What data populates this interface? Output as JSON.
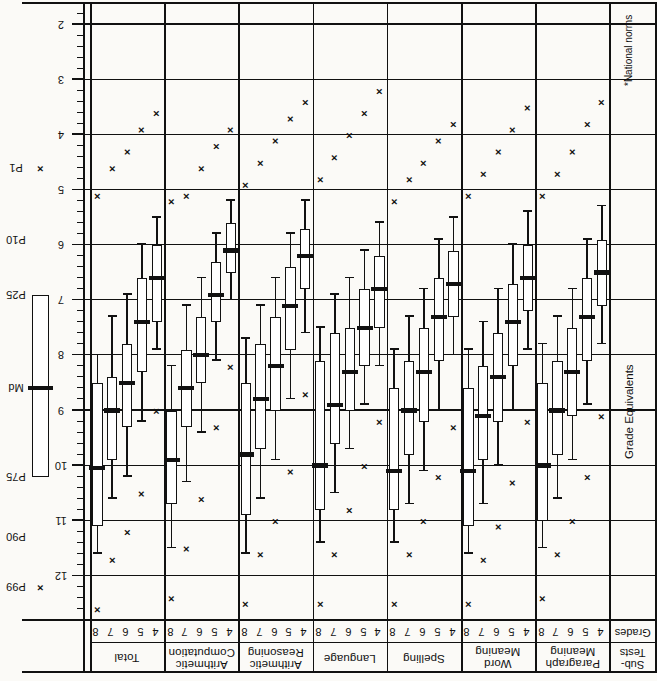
{
  "figure": {
    "axis_title": "Grade Equivalents",
    "footnote": "*National norms",
    "header_subtests": "Sub-\nTests",
    "header_grades": "Grades"
  },
  "legend": {
    "labels": [
      "P99",
      "P90",
      "P75",
      "Md",
      "P25",
      "P10",
      "P1"
    ],
    "marker_note": "box-and-whisker percentile key"
  },
  "axis": {
    "label": "Grade Equivalents",
    "tick_labels": [
      "12",
      "11",
      "10",
      "9",
      "8",
      "7",
      "6",
      "5",
      "4",
      "3",
      "2"
    ],
    "major_values": [
      12,
      11,
      10,
      9,
      8,
      7,
      6,
      5,
      4,
      3,
      2
    ],
    "minor_per_major": 5,
    "range": [
      12.6,
      1.7
    ],
    "direction": "descending-left-to-right"
  },
  "grades": [
    "8",
    "7",
    "6",
    "5",
    "4"
  ],
  "chart_data": {
    "type": "box",
    "xlabel": "Grade Equivalents",
    "ylabel": "Sub-Tests / Grades",
    "xlim": [
      12.6,
      1.7
    ],
    "grid": true,
    "legend_position": "top",
    "percentiles": [
      "P99",
      "P90",
      "P75",
      "Md",
      "P25",
      "P10",
      "P1"
    ],
    "subtests": [
      {
        "name": "Total",
        "rows": [
          {
            "grade": "8",
            "P99": 12.6,
            "P90": 11.6,
            "P75": 11.1,
            "Md": 10.05,
            "P25": 8.5,
            "P10": 8.0,
            "P1": 5.1
          },
          {
            "grade": "7",
            "P99": 11.7,
            "P90": 10.6,
            "P75": 9.9,
            "Md": 9.0,
            "P25": 8.4,
            "P10": 7.3,
            "P1": 4.6
          },
          {
            "grade": "6",
            "P99": 11.2,
            "P90": 10.2,
            "P75": 9.3,
            "Md": 8.5,
            "P25": 7.8,
            "P10": 6.9,
            "P1": 4.3
          },
          {
            "grade": "5",
            "P99": 10.5,
            "P90": 9.2,
            "P75": 8.3,
            "Md": 7.4,
            "P25": 6.6,
            "P10": 6.0,
            "P1": 3.9
          },
          {
            "grade": "4",
            "P99": 9.0,
            "P90": 7.9,
            "P75": 7.4,
            "Md": 6.6,
            "P25": 6.0,
            "P10": 5.5,
            "P1": 3.6
          }
        ]
      },
      {
        "name": "Arithmetic\nComputation",
        "rows": [
          {
            "grade": "8",
            "P99": 12.4,
            "P90": 11.5,
            "P75": 10.7,
            "Md": 9.9,
            "P25": 9.0,
            "P10": 8.2,
            "P1": 5.2
          },
          {
            "grade": "7",
            "P99": 11.5,
            "P90": 10.3,
            "P75": 9.3,
            "Md": 8.6,
            "P25": 7.9,
            "P10": 7.1,
            "P1": 5.1
          },
          {
            "grade": "6",
            "P99": 10.6,
            "P90": 9.4,
            "P75": 8.5,
            "Md": 8.0,
            "P25": 7.3,
            "P10": 6.6,
            "P1": 4.6
          },
          {
            "grade": "5",
            "P99": 9.3,
            "P90": 8.1,
            "P75": 7.4,
            "Md": 6.9,
            "P25": 6.3,
            "P10": 5.8,
            "P1": 4.2
          },
          {
            "grade": "4",
            "P99": 8.2,
            "P90": 7.0,
            "P75": 6.5,
            "Md": 6.1,
            "P25": 5.6,
            "P10": 5.2,
            "P1": 3.9
          }
        ]
      },
      {
        "name": "Arithmetic\nReasoning",
        "rows": [
          {
            "grade": "8",
            "P99": 12.5,
            "P90": 11.6,
            "P75": 10.9,
            "Md": 9.8,
            "P25": 8.5,
            "P10": 7.7,
            "P1": 4.9
          },
          {
            "grade": "7",
            "P99": 11.6,
            "P90": 10.6,
            "P75": 9.7,
            "Md": 8.8,
            "P25": 7.8,
            "P10": 7.1,
            "P1": 4.5
          },
          {
            "grade": "6",
            "P99": 11.0,
            "P90": 9.9,
            "P75": 9.0,
            "Md": 8.2,
            "P25": 7.3,
            "P10": 6.6,
            "P1": 4.1
          },
          {
            "grade": "5",
            "P99": 10.1,
            "P90": 8.8,
            "P75": 7.9,
            "Md": 7.1,
            "P25": 6.4,
            "P10": 5.8,
            "P1": 3.7
          },
          {
            "grade": "4",
            "P99": 8.7,
            "P90": 7.6,
            "P75": 6.8,
            "Md": 6.2,
            "P25": 5.7,
            "P10": 5.2,
            "P1": 3.4
          }
        ]
      },
      {
        "name": "Language",
        "rows": [
          {
            "grade": "8",
            "P99": 12.5,
            "P90": 11.4,
            "P75": 10.8,
            "Md": 10.0,
            "P25": 8.1,
            "P10": 7.5,
            "P1": 4.8
          },
          {
            "grade": "7",
            "P99": 11.6,
            "P90": 10.5,
            "P75": 9.6,
            "Md": 8.9,
            "P25": 7.6,
            "P10": 6.9,
            "P1": 4.4
          },
          {
            "grade": "6",
            "P99": 10.8,
            "P90": 9.7,
            "P75": 9.0,
            "Md": 8.3,
            "P25": 7.5,
            "P10": 6.6,
            "P1": 4.0
          },
          {
            "grade": "5",
            "P99": 10.0,
            "P90": 8.9,
            "P75": 8.2,
            "Md": 7.5,
            "P25": 6.8,
            "P10": 6.1,
            "P1": 3.6
          },
          {
            "grade": "4",
            "P99": 9.2,
            "P90": 8.2,
            "P75": 7.5,
            "Md": 6.8,
            "P25": 6.2,
            "P10": 5.6,
            "P1": 3.2
          }
        ]
      },
      {
        "name": "Spelling",
        "rows": [
          {
            "grade": "8",
            "P99": 12.5,
            "P90": 11.4,
            "P75": 10.8,
            "Md": 10.1,
            "P25": 8.6,
            "P10": 7.9,
            "P1": 5.2
          },
          {
            "grade": "7",
            "P99": 11.6,
            "P90": 10.7,
            "P75": 9.8,
            "Md": 9.0,
            "P25": 8.1,
            "P10": 7.3,
            "P1": 4.8
          },
          {
            "grade": "6",
            "P99": 11.0,
            "P90": 10.1,
            "P75": 9.2,
            "Md": 8.3,
            "P25": 7.5,
            "P10": 6.8,
            "P1": 4.5
          },
          {
            "grade": "5",
            "P99": 10.2,
            "P90": 9.0,
            "P75": 8.1,
            "Md": 7.3,
            "P25": 6.6,
            "P10": 5.9,
            "P1": 4.1
          },
          {
            "grade": "4",
            "P99": 9.3,
            "P90": 8.0,
            "P75": 7.3,
            "Md": 6.7,
            "P25": 6.1,
            "P10": 5.5,
            "P1": 3.8
          }
        ]
      },
      {
        "name": "Word\nMeaning",
        "rows": [
          {
            "grade": "8",
            "P99": 12.5,
            "P90": 11.6,
            "P75": 11.1,
            "Md": 10.1,
            "P25": 8.6,
            "P10": 7.9,
            "P1": 5.1
          },
          {
            "grade": "7",
            "P99": 11.7,
            "P90": 10.7,
            "P75": 9.9,
            "Md": 9.1,
            "P25": 8.2,
            "P10": 7.4,
            "P1": 4.7
          },
          {
            "grade": "6",
            "P99": 11.1,
            "P90": 10.0,
            "P75": 9.2,
            "Md": 8.4,
            "P25": 7.6,
            "P10": 6.8,
            "P1": 4.3
          },
          {
            "grade": "5",
            "P99": 10.3,
            "P90": 9.0,
            "P75": 8.2,
            "Md": 7.4,
            "P25": 6.7,
            "P10": 6.0,
            "P1": 3.9
          },
          {
            "grade": "4",
            "P99": 9.2,
            "P90": 7.9,
            "P75": 7.2,
            "Md": 6.6,
            "P25": 6.0,
            "P10": 5.4,
            "P1": 3.5
          }
        ]
      },
      {
        "name": "Paragraph\nMeaning",
        "rows": [
          {
            "grade": "8",
            "P99": 12.4,
            "P90": 11.5,
            "P75": 11.0,
            "Md": 10.0,
            "P25": 8.5,
            "P10": 7.8,
            "P1": 5.1
          },
          {
            "grade": "7",
            "P99": 11.6,
            "P90": 10.6,
            "P75": 9.8,
            "Md": 9.0,
            "P25": 8.1,
            "P10": 7.3,
            "P1": 4.7
          },
          {
            "grade": "6",
            "P99": 11.0,
            "P90": 9.9,
            "P75": 9.1,
            "Md": 8.3,
            "P25": 7.5,
            "P10": 6.8,
            "P1": 4.3
          },
          {
            "grade": "5",
            "P99": 10.2,
            "P90": 8.9,
            "P75": 8.1,
            "Md": 7.3,
            "P25": 6.6,
            "P10": 5.9,
            "P1": 3.8
          },
          {
            "grade": "4",
            "P99": 9.1,
            "P90": 7.8,
            "P75": 7.1,
            "Md": 6.5,
            "P25": 5.9,
            "P10": 5.3,
            "P1": 3.4
          }
        ]
      }
    ],
    "legend_sample": {
      "P99": 12.2,
      "P90": 11.3,
      "P75": 10.2,
      "Md": 8.6,
      "P25": 6.9,
      "P10": 5.9,
      "P1": 4.6
    }
  }
}
